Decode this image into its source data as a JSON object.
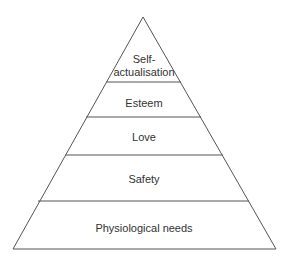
{
  "diagram": {
    "type": "pyramid",
    "levels": [
      {
        "label_line1": "Self-",
        "label_line2": "actualisation"
      },
      {
        "label": "Esteem"
      },
      {
        "label": "Love"
      },
      {
        "label": "Safety"
      },
      {
        "label": "Physiological needs"
      }
    ],
    "colors": {
      "line": "#555555",
      "text": "#333333",
      "background": "#ffffff"
    }
  }
}
